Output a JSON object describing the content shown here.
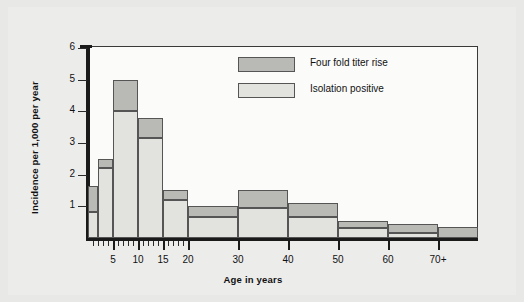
{
  "chart_data": {
    "type": "bar",
    "subtype": "stacked-histogram",
    "title": "",
    "xlabel": "Age in years",
    "ylabel": "Incidence per 1,000 per year",
    "ylim": [
      0,
      6.6
    ],
    "yticks": [
      1,
      2,
      3,
      4,
      5,
      6
    ],
    "ytick_labels": [
      "1",
      "2",
      "3",
      "4",
      "5",
      "6"
    ],
    "xlim": [
      0,
      78
    ],
    "xticks": [
      5,
      10,
      15,
      20,
      30,
      40,
      50,
      60,
      70
    ],
    "xtick_labels": [
      "5",
      "10",
      "15",
      "20",
      "30",
      "40",
      "50",
      "60",
      "70+"
    ],
    "x_minor_tick_interval": 1,
    "grid": false,
    "legend_position": "upper center",
    "bin_edges": [
      0,
      2,
      5,
      10,
      15,
      20,
      30,
      40,
      50,
      60,
      70,
      78
    ],
    "categories": [
      "0-2",
      "2-5",
      "5-10",
      "10-15",
      "15-20",
      "20-30",
      "30-40",
      "40-50",
      "50-60",
      "60-70",
      "70+"
    ],
    "series": [
      {
        "name": "Isolation positive",
        "color": "#e2e2df",
        "values": [
          0.82,
          2.2,
          4.0,
          3.15,
          1.2,
          0.65,
          0.95,
          0.65,
          0.3,
          0.15,
          0.0
        ]
      },
      {
        "name": "Four fold titer rise",
        "color": "#b9b9b6",
        "values": [
          0.83,
          0.3,
          1.0,
          0.62,
          0.3,
          0.35,
          0.57,
          0.45,
          0.25,
          0.3,
          0.35
        ]
      }
    ],
    "totals": [
      1.65,
      2.5,
      5.0,
      3.77,
      1.5,
      1.0,
      1.52,
      1.1,
      0.55,
      0.45,
      0.35
    ]
  },
  "legend": {
    "items": [
      {
        "label": "Four fold titer rise",
        "swatch": "dark"
      },
      {
        "label": "Isolation positive",
        "swatch": "light"
      }
    ]
  },
  "axes": {
    "y_title": "Incidence per 1,000 per year",
    "x_title": "Age in years"
  }
}
